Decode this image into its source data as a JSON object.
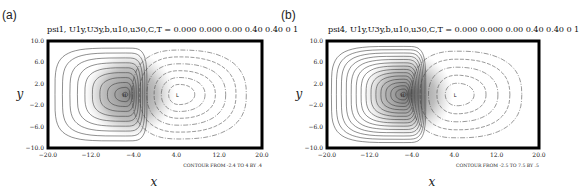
{
  "panels": [
    {
      "label": "(a)",
      "title": "psi1,  U1y,U3y,b,u10,u30,C,T = 0.000  0.000  0.00  0.40  0.40  0  1"
    },
    {
      "label": "(b)",
      "title": "psi4,  U1y,U3y,b,u10,u30,C,T = 0.000  0.000  0.00  0.40  0.40  0  1"
    }
  ],
  "chart_data": [
    {
      "type": "heatmap",
      "subtype": "contour",
      "title": "psi1,  U1y,U3y,b,u10,u30,C,T = 0.000  0.000  0.00  0.40  0.40  0  1",
      "panel_label": "(a)",
      "xlabel": "x",
      "ylabel": "y",
      "xlim": [
        -20,
        20
      ],
      "ylim": [
        -10,
        10
      ],
      "xticks": [
        "-20.0",
        "-12.0",
        "-4.0",
        "4.0",
        "12.0",
        "20.0"
      ],
      "yticks": [
        "10.0",
        "6.0",
        "2.0",
        "-2.0",
        "-6.0",
        "-10.0"
      ],
      "contour_note": "CONTOUR FROM -2.4 TO 4 BY .4",
      "contour_min": -2.4,
      "contour_max": 4,
      "contour_step": 0.4,
      "high": {
        "label": "H",
        "x": -5.5,
        "y": 0
      },
      "low": {
        "label": "L",
        "x": 4.5,
        "y": 0
      },
      "positive_style": "solid",
      "negative_style": "dashed",
      "grid": false
    },
    {
      "type": "heatmap",
      "subtype": "contour",
      "title": "psi4,  U1y,U3y,b,u10,u30,C,T = 0.000  0.000  0.00  0.40  0.40  0  1",
      "panel_label": "(b)",
      "xlabel": "x",
      "ylabel": "y",
      "xlim": [
        -20,
        20
      ],
      "ylim": [
        -10,
        10
      ],
      "xticks": [
        "-20.0",
        "-12.0",
        "-4.0",
        "4.0",
        "12.0",
        "20.0"
      ],
      "yticks": [
        "10.0",
        "6.0",
        "2.0",
        "-2.0",
        "-6.0",
        "-10.0"
      ],
      "contour_note": "CONTOUR FROM -2.5 TO 7.5 BY .5",
      "contour_min": -2.5,
      "contour_max": 7.5,
      "contour_step": 0.5,
      "high": {
        "label": "H",
        "x": -5.5,
        "y": 0
      },
      "low": {
        "label": "L",
        "x": 4.5,
        "y": 0
      },
      "positive_style": "solid",
      "negative_style": "dashed",
      "grid": false
    }
  ]
}
